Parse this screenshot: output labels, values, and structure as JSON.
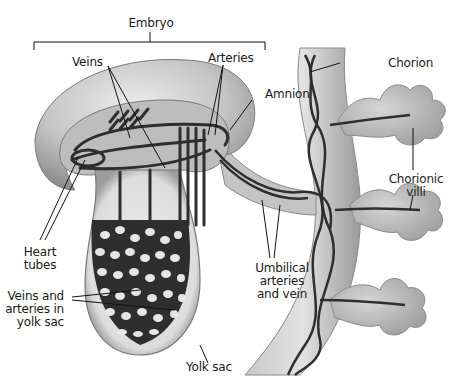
{
  "diagram": {
    "colors": {
      "tissue_light": "#d8d8d8",
      "tissue_mid": "#b0b0b0",
      "tissue_dark": "#8a8a8a",
      "vessel": "#2e2e2e",
      "leader_line": "#111111",
      "background": "#ffffff"
    },
    "labels": {
      "embryo": "Embryo",
      "veins": "Veins",
      "arteries": "Arteries",
      "amnion": "Amnion",
      "chorion": "Chorion",
      "chorionic_villi_1": "Chorionic",
      "chorionic_villi_2": "villi",
      "heart_tubes_1": "Heart",
      "heart_tubes_2": "tubes",
      "umbilical_1": "Umbilical",
      "umbilical_2": "arteries",
      "umbilical_3": "and vein",
      "yolk_vessels_1": "Veins and",
      "yolk_vessels_2": "arteries in",
      "yolk_vessels_3": "yolk sac",
      "yolk_sac": "Yolk sac"
    }
  }
}
